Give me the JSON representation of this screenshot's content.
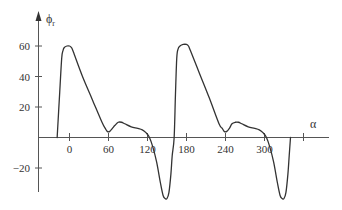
{
  "chart_data": {
    "type": "line",
    "title": "",
    "xlabel": "α",
    "ylabel": "ϕ",
    "ylabel_subscript": "r",
    "x_ticks": [
      0,
      60,
      120,
      180,
      240,
      300,
      360
    ],
    "x_tick_labels": [
      "0",
      "60",
      "120",
      "180",
      "240",
      "300",
      ""
    ],
    "y_ticks": [
      60,
      40,
      20,
      -20
    ],
    "y_tick_labels": [
      "60",
      "40",
      "20",
      "−20"
    ],
    "xlim": [
      -50,
      400
    ],
    "ylim": [
      -45,
      75
    ],
    "grid": false,
    "legend": null,
    "series": [
      {
        "name": "phi_r",
        "x": [
          -19,
          -15,
          -12,
          -10,
          -8,
          -4,
          0,
          3,
          6,
          20,
          35,
          50,
          55,
          58,
          62,
          66,
          70,
          75,
          80,
          85,
          95,
          105,
          112,
          118,
          123,
          128,
          134,
          140,
          144,
          147,
          150,
          153,
          156,
          158,
          161,
          163,
          165,
          167,
          170,
          175,
          180,
          183,
          186,
          200,
          215,
          230,
          235,
          238,
          242,
          246,
          250,
          255,
          260,
          265,
          275,
          285,
          292,
          298,
          303,
          308,
          314,
          320,
          324,
          327,
          330,
          333,
          336,
          338,
          340
        ],
        "y": [
          0,
          30,
          52,
          57,
          59,
          60,
          60,
          59,
          56,
          40,
          25,
          10,
          6,
          4,
          4,
          6,
          8,
          10,
          10,
          9,
          7,
          6,
          5,
          3,
          0,
          -6,
          -16,
          -30,
          -38,
          -40,
          -40,
          -36,
          -24,
          -12,
          0,
          28,
          52,
          58,
          60,
          61,
          61,
          60,
          57,
          42,
          26,
          9,
          6,
          4,
          4,
          6,
          9,
          10,
          10,
          9,
          7,
          6,
          5,
          3,
          0,
          -6,
          -16,
          -30,
          -38,
          -40,
          -40,
          -36,
          -24,
          -12,
          0
        ]
      }
    ]
  }
}
